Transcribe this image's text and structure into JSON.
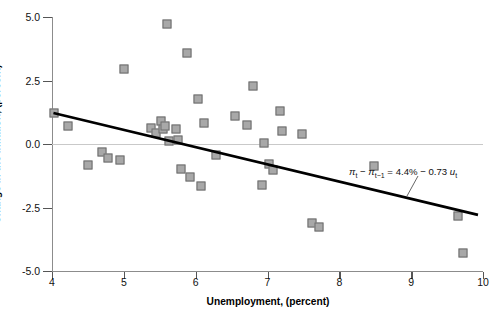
{
  "chart_data": {
    "type": "scatter",
    "title": "",
    "xlabel": "Unemployment, (percent)",
    "ylabel": "Change in the inflation, (percent)",
    "xlim": [
      4,
      10
    ],
    "ylim": [
      -5.0,
      5.0
    ],
    "xticks": [
      4,
      5,
      6,
      7,
      8,
      9,
      10
    ],
    "xticklabels": [
      "4",
      "5",
      "6",
      "7",
      "8",
      "9",
      "10"
    ],
    "yticks": [
      5.0,
      2.5,
      0.0,
      -2.5,
      -5.0
    ],
    "yticklabels": [
      "5.0",
      "2.5",
      "0.0",
      "-2.5",
      "-5.0"
    ],
    "grid": false,
    "zero_line": true,
    "legend": null,
    "marker": {
      "shape": "square",
      "face_color": "#a8a8a8",
      "edge_color": "#6d6d6d",
      "size_px": 9
    },
    "points": [
      {
        "x": 4.03,
        "y": 1.22
      },
      {
        "x": 4.22,
        "y": 0.7
      },
      {
        "x": 4.5,
        "y": -0.82
      },
      {
        "x": 4.7,
        "y": -0.3
      },
      {
        "x": 4.78,
        "y": -0.55
      },
      {
        "x": 4.95,
        "y": -0.62
      },
      {
        "x": 5.0,
        "y": 2.97
      },
      {
        "x": 5.38,
        "y": 0.62
      },
      {
        "x": 5.45,
        "y": 0.45
      },
      {
        "x": 5.52,
        "y": 0.9
      },
      {
        "x": 5.55,
        "y": 0.6
      },
      {
        "x": 5.58,
        "y": 0.7
      },
      {
        "x": 5.6,
        "y": 4.72
      },
      {
        "x": 5.63,
        "y": 0.1
      },
      {
        "x": 5.72,
        "y": 0.6
      },
      {
        "x": 5.76,
        "y": 0.16
      },
      {
        "x": 5.8,
        "y": -1.0
      },
      {
        "x": 5.88,
        "y": 3.58
      },
      {
        "x": 5.92,
        "y": -1.28
      },
      {
        "x": 6.03,
        "y": 1.78
      },
      {
        "x": 6.08,
        "y": -1.65
      },
      {
        "x": 6.12,
        "y": 0.82
      },
      {
        "x": 6.28,
        "y": -0.42
      },
      {
        "x": 6.55,
        "y": 1.1
      },
      {
        "x": 6.72,
        "y": 0.75
      },
      {
        "x": 6.8,
        "y": 2.3
      },
      {
        "x": 6.92,
        "y": -1.6
      },
      {
        "x": 6.95,
        "y": 0.02
      },
      {
        "x": 7.02,
        "y": -0.78
      },
      {
        "x": 7.08,
        "y": -1.02
      },
      {
        "x": 7.18,
        "y": 1.28
      },
      {
        "x": 7.2,
        "y": 0.52
      },
      {
        "x": 7.48,
        "y": 0.38
      },
      {
        "x": 7.62,
        "y": -3.1
      },
      {
        "x": 7.72,
        "y": -3.28
      },
      {
        "x": 8.48,
        "y": -0.88
      },
      {
        "x": 9.65,
        "y": -2.85
      },
      {
        "x": 9.72,
        "y": -4.28
      }
    ],
    "fit_line": {
      "label": "pi_t - pi_t-1 = 4.4% - 0.73 u_t",
      "intercept": 4.4,
      "slope": -0.73,
      "x_start": 4.02,
      "y_start": 1.22,
      "x_end": 9.93,
      "y_end": -2.79,
      "color": "#000000",
      "width_px": 2.6
    },
    "annotation": {
      "text_parts": {
        "pi1": "π",
        "sub1": "t",
        "minus1": " − ",
        "pi2": "π",
        "sub2": "t−1",
        "equals": " = 4.4% − 0.73 ",
        "u": "u",
        "sub3": "t"
      },
      "leader_line": true
    }
  }
}
